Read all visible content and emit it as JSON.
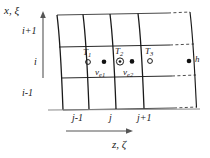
{
  "figure": {
    "type": "curvilinear-grid-diagram",
    "background_color": "#ffffff",
    "line_color": "#1a1a1a",
    "grid_line_color": "#3a3a3a",
    "axes": {
      "vertical": {
        "label": "x, ξ",
        "label_parts": {
          "cartesian": "x",
          "curvilinear": "ξ"
        },
        "arrow": "up"
      },
      "horizontal": {
        "label": "z, ζ",
        "label_parts": {
          "cartesian": "z",
          "curvilinear": "ζ"
        },
        "arrow": "right"
      }
    },
    "row_indices": [
      "i+1",
      "i",
      "i-1"
    ],
    "column_indices": [
      "j-1",
      "j",
      "j+1"
    ],
    "nodes": [
      {
        "label": "T",
        "subscript": "1",
        "marker": "open-circle"
      },
      {
        "label": "T",
        "subscript": "2",
        "marker": "circle-dot"
      },
      {
        "label": "T",
        "subscript": "3",
        "marker": "open-circle"
      }
    ],
    "velocity_nodes": [
      {
        "label": "ν",
        "subscript": "e1",
        "marker": "filled-dot"
      },
      {
        "label": "ν",
        "subscript": "e2",
        "marker": "filled-dot"
      }
    ],
    "boundary_node": {
      "label": "h",
      "marker": "filled-dot"
    },
    "dashed_connectors": 3
  }
}
